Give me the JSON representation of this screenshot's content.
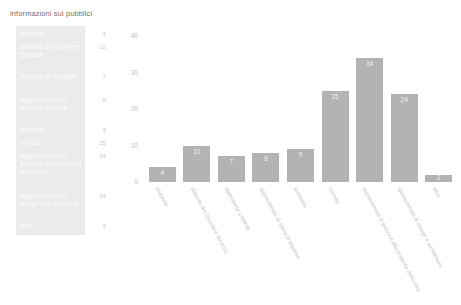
{
  "panel": {
    "title": "informazioni sui pubblici",
    "rows": [
      {
        "label": "studente",
        "value": "4",
        "top": 4
      },
      {
        "label": "abitante del quartiere Bicocca",
        "value": "10",
        "top": 17
      },
      {
        "label": "dipendente UNIMIB",
        "value": "7",
        "top": 47
      },
      {
        "label": "appassionato di storia di impresa",
        "value": "8",
        "top": 70
      },
      {
        "label": "architetto",
        "value": "9",
        "top": 100
      },
      {
        "label": "curioso",
        "value": "25",
        "top": 113
      },
      {
        "label": "appassionato di percorsi alla scoperta della città",
        "value": "34",
        "top": 126
      },
      {
        "label": "appassionato di design e architettura",
        "value": "24",
        "top": 166
      },
      {
        "label": "altro",
        "value": "2",
        "top": 196
      }
    ]
  },
  "chart_data": {
    "type": "bar",
    "title": "",
    "xlabel": "",
    "ylabel": "",
    "ylim": [
      0,
      40
    ],
    "yticks": [
      40,
      30,
      20,
      10,
      0
    ],
    "grid": false,
    "legend": "none",
    "bar_color": "#b3b3b3",
    "categories": [
      "studente",
      "abitante del Quartiere Bicocca",
      "dipendente UNIMIB",
      "appassionato di storia di impresa",
      "architetto",
      "curioso",
      "appassionato di percorsi alla scoperta della città",
      "appassionato di design e architettura",
      "altro"
    ],
    "values": [
      4,
      10,
      7,
      8,
      9,
      25,
      34,
      24,
      2
    ]
  }
}
